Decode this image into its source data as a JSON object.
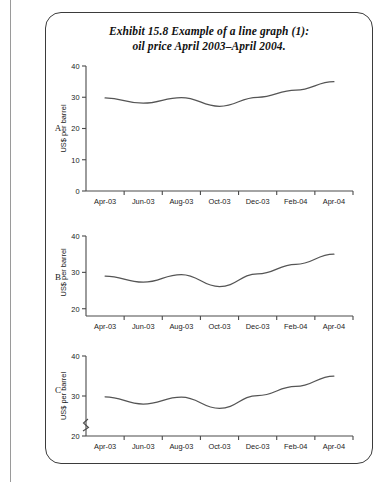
{
  "exhibit": {
    "title_line1": "Exhibit 15.8  Example of a line graph (1):",
    "title_line2": "oil price April 2003–April 2004.",
    "panel_labels": [
      "A",
      "B",
      "C"
    ],
    "frame_color": "#3b3b3b",
    "line_color": "#555555",
    "axis_color": "#4a4a4a",
    "background": "#ffffff"
  },
  "chart_data": [
    {
      "type": "line",
      "panel": "A",
      "title": "",
      "xlabel": "",
      "ylabel": "US$ per barrel",
      "categories": [
        "Apr-03",
        "Jun-03",
        "Aug-03",
        "Oct-03",
        "Dec-03",
        "Feb-04",
        "Apr-04"
      ],
      "x": [
        0,
        1,
        2,
        3,
        4,
        5,
        6
      ],
      "values": [
        29.8,
        28.1,
        29.9,
        27.1,
        30.0,
        32.3,
        35.0
      ],
      "ylim": [
        0,
        40
      ],
      "yticks": [
        0,
        10,
        20,
        30,
        40
      ],
      "ytick_labels": [
        "0",
        "10",
        "20",
        "30",
        "40"
      ],
      "axis_break": false,
      "grid": false,
      "legend": false
    },
    {
      "type": "line",
      "panel": "B",
      "title": "",
      "xlabel": "",
      "ylabel": "US$ per barrel",
      "categories": [
        "Apr-03",
        "Jun-03",
        "Aug-03",
        "Oct-03",
        "Dec-03",
        "Feb-04",
        "Apr-04"
      ],
      "x": [
        0,
        1,
        2,
        3,
        4,
        5,
        6
      ],
      "values": [
        29.0,
        27.3,
        29.4,
        26.1,
        29.6,
        32.2,
        35.0
      ],
      "ylim": [
        18,
        40
      ],
      "yticks": [
        20,
        30,
        40
      ],
      "ytick_labels": [
        "20",
        "30",
        "40"
      ],
      "axis_break": false,
      "grid": false,
      "legend": false
    },
    {
      "type": "line",
      "panel": "C",
      "title": "",
      "xlabel": "",
      "ylabel": "US$ per barrel",
      "categories": [
        "Apr-03",
        "Jun-03",
        "Aug-03",
        "Oct-03",
        "Dec-03",
        "Feb-04",
        "Apr-04"
      ],
      "x": [
        0,
        1,
        2,
        3,
        4,
        5,
        6
      ],
      "values": [
        29.8,
        28.0,
        29.7,
        26.9,
        30.1,
        32.4,
        35.0
      ],
      "ylim": [
        20,
        40
      ],
      "yticks": [
        20,
        30,
        40
      ],
      "ytick_labels": [
        "20",
        "30",
        "40"
      ],
      "axis_break": true,
      "axis_break_note": "zigzag break on y-axis above the 20 tick",
      "grid": false,
      "legend": false
    }
  ]
}
